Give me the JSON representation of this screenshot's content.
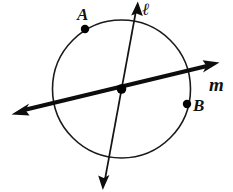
{
  "diagram": {
    "background_color": "#ffffff",
    "stroke_color": "#111111",
    "width": 233,
    "height": 192,
    "circle": {
      "name": "circle",
      "center_x": 121.5,
      "center_y": 89,
      "radius": 69,
      "stroke_width": 1.6
    },
    "lines": [
      {
        "id": "l",
        "label": "ℓ",
        "label_x": 142,
        "label_y": 15,
        "x1": 136.5,
        "y1": 5,
        "x2": 104,
        "y2": 187,
        "stroke_width": 1.7,
        "arrow_start": true,
        "arrow_end": true,
        "style": "thin"
      },
      {
        "id": "m",
        "label": "m",
        "label_x": 209,
        "label_y": 91,
        "x1": 215,
        "y1": 64,
        "x2": 15,
        "y2": 112,
        "stroke_width": 4.2,
        "arrow_start": true,
        "arrow_end": true,
        "style": "thick"
      }
    ],
    "points": [
      {
        "id": "A",
        "label": "A",
        "x": 85,
        "y": 29,
        "radius": 4.2,
        "label_x": 77,
        "label_y": 20,
        "on": "circle"
      },
      {
        "id": "B",
        "label": "B",
        "x": 187,
        "y": 104,
        "radius": 4.2,
        "label_x": 193,
        "label_y": 111,
        "on": "circle"
      },
      {
        "id": "center",
        "label": "",
        "x": 121.5,
        "y": 89,
        "radius": 4.6,
        "label_x": 0,
        "label_y": 0,
        "on": "intersection"
      }
    ]
  }
}
